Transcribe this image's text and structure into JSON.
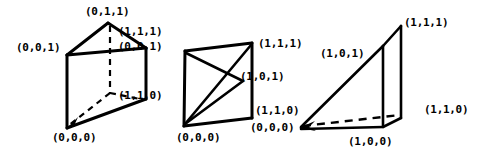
{
  "figure": {
    "caption": "",
    "background_color": "#ffffff",
    "ink_color": "#000000",
    "shapes": [
      {
        "name": "triangular-prism",
        "labels": [
          {
            "id": "l1",
            "text": "(0,1,1)",
            "x": 85,
            "y": 6
          },
          {
            "id": "l2",
            "text": "(1,1,1)",
            "x": 118,
            "y": 26
          },
          {
            "id": "l3",
            "text": "(0,0,1)",
            "x": 16,
            "y": 42
          },
          {
            "id": "l4",
            "text": "(0,0,1)",
            "x": 118,
            "y": 41
          },
          {
            "id": "l5",
            "text": "(1,1,0)",
            "x": 118,
            "y": 90
          },
          {
            "id": "l6",
            "text": "(0,0,0)",
            "x": 52,
            "y": 132
          }
        ]
      },
      {
        "name": "square-face-with-diagonals",
        "labels": [
          {
            "id": "m1",
            "text": "(1,1,1)",
            "x": 258,
            "y": 38
          },
          {
            "id": "m2",
            "text": "(1,0,1)",
            "x": 240,
            "y": 71
          },
          {
            "id": "m3",
            "text": "(1,1,0)",
            "x": 255,
            "y": 105
          },
          {
            "id": "m4",
            "text": "(0,0,0)",
            "x": 250,
            "y": 122
          },
          {
            "id": "m5",
            "text": "(0,0,0)",
            "x": 176,
            "y": 132
          }
        ]
      },
      {
        "name": "wedge-tetrahedron",
        "labels": [
          {
            "id": "r1",
            "text": "(1,1,1)",
            "x": 404,
            "y": 17
          },
          {
            "id": "r2",
            "text": "(1,0,1)",
            "x": 320,
            "y": 48
          },
          {
            "id": "r3",
            "text": "(1,1,0)",
            "x": 424,
            "y": 104
          },
          {
            "id": "r4",
            "text": "(1,0,0)",
            "x": 348,
            "y": 136
          }
        ]
      }
    ]
  }
}
